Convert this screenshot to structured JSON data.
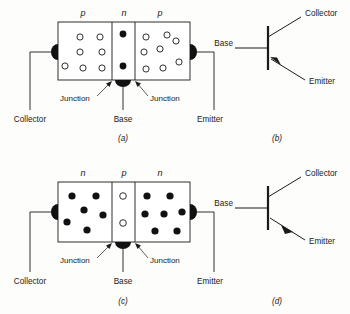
{
  "figure": {
    "background_color": "#fdfdfb",
    "ink_color": "#1a1a1a"
  },
  "panels": [
    {
      "id": "a",
      "caption": "(a)",
      "kind": "structure",
      "device_type": "pnp",
      "region_labels": [
        "p",
        "n",
        "p"
      ],
      "regions": [
        {
          "name": "collector-region",
          "label": "p",
          "carrier": "hole",
          "carrier_count": 8
        },
        {
          "name": "base-region",
          "label": "n",
          "carrier": "electron",
          "carrier_count": 2
        },
        {
          "name": "emitter-region",
          "label": "p",
          "carrier": "hole",
          "carrier_count": 8
        }
      ],
      "junction_labels": [
        "Junction",
        "Junction"
      ],
      "terminals": [
        {
          "name": "collector",
          "label": "Collector"
        },
        {
          "name": "base",
          "label": "Base"
        },
        {
          "name": "emitter",
          "label": "Emitter"
        }
      ]
    },
    {
      "id": "b",
      "caption": "(b)",
      "kind": "symbol",
      "device_type": "pnp",
      "arrow_direction": "into-base",
      "terminals": [
        {
          "name": "base",
          "label": "Base"
        },
        {
          "name": "collector",
          "label": "Collector"
        },
        {
          "name": "emitter",
          "label": "Emitter"
        }
      ]
    },
    {
      "id": "c",
      "caption": "(c)",
      "kind": "structure",
      "device_type": "npn",
      "region_labels": [
        "n",
        "p",
        "n"
      ],
      "regions": [
        {
          "name": "collector-region",
          "label": "n",
          "carrier": "electron",
          "carrier_count": 6
        },
        {
          "name": "base-region",
          "label": "p",
          "carrier": "hole",
          "carrier_count": 2
        },
        {
          "name": "emitter-region",
          "label": "n",
          "carrier": "electron",
          "carrier_count": 7
        }
      ],
      "junction_labels": [
        "Junction",
        "Junction"
      ],
      "terminals": [
        {
          "name": "collector",
          "label": "Collector"
        },
        {
          "name": "base",
          "label": "Base"
        },
        {
          "name": "emitter",
          "label": "Emitter"
        }
      ]
    },
    {
      "id": "d",
      "caption": "(d)",
      "kind": "symbol",
      "device_type": "npn",
      "arrow_direction": "out-of-base",
      "terminals": [
        {
          "name": "base",
          "label": "Base"
        },
        {
          "name": "collector",
          "label": "Collector"
        },
        {
          "name": "emitter",
          "label": "Emitter"
        }
      ]
    }
  ]
}
